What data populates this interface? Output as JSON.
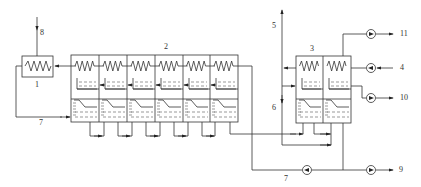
{
  "diagram": {
    "type": "process-flow",
    "labels": {
      "n1": "1",
      "n2": "2",
      "n3": "3",
      "n4": "4",
      "n5": "5",
      "n6": "6",
      "n7a": "7",
      "n7b": "7",
      "n8": "8",
      "n9": "9",
      "n10": "10",
      "n11": "11"
    },
    "units": {
      "heat_exchanger": {
        "label": "1"
      },
      "main_effect_block": {
        "label": "2",
        "cells": 6
      },
      "secondary_block": {
        "label": "3",
        "cells": 2
      }
    },
    "streams": [
      "4",
      "5",
      "6",
      "7",
      "8",
      "9",
      "10",
      "11"
    ],
    "pumps": 5
  }
}
